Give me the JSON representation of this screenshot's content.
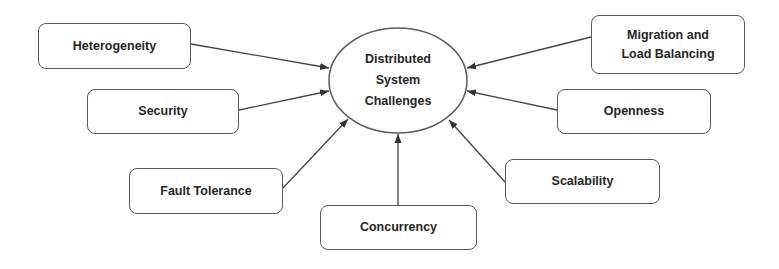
{
  "diagram": {
    "center": {
      "label": "Distributed\nSystem\nChallenges"
    },
    "nodes": [
      {
        "id": "heterogeneity",
        "label": "Heterogeneity"
      },
      {
        "id": "security",
        "label": "Security"
      },
      {
        "id": "fault-tolerance",
        "label": "Fault Tolerance"
      },
      {
        "id": "concurrency",
        "label": "Concurrency"
      },
      {
        "id": "scalability",
        "label": "Scalability"
      },
      {
        "id": "openness",
        "label": "Openness"
      },
      {
        "id": "migration",
        "label": "Migration and\nLoad Balancing"
      }
    ],
    "edges": [
      {
        "from": "heterogeneity",
        "to": "center"
      },
      {
        "from": "security",
        "to": "center"
      },
      {
        "from": "fault-tolerance",
        "to": "center"
      },
      {
        "from": "concurrency",
        "to": "center"
      },
      {
        "from": "scalability",
        "to": "center"
      },
      {
        "from": "openness",
        "to": "center"
      },
      {
        "from": "migration",
        "to": "center"
      }
    ],
    "colors": {
      "stroke": "#5a5a5a",
      "text": "#262626",
      "fill": "#ffffff"
    }
  }
}
